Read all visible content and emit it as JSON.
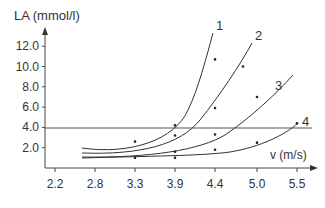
{
  "chart_data": {
    "type": "line",
    "title": "",
    "xlabel": "v (m/s)",
    "ylabel": "LA (mmol/l)",
    "x_ticks": [
      "2.2",
      "2.8",
      "3.3",
      "3.9",
      "4.4",
      "5.0",
      "5.5"
    ],
    "y_ticks": [
      "2.0",
      "4.0",
      "6.0",
      "8.0",
      "10.0",
      "12.0"
    ],
    "ylim": [
      0,
      13
    ],
    "grid": false,
    "threshold_line": {
      "y": 4.0,
      "label": ""
    },
    "series": [
      {
        "name": "1",
        "points": [
          [
            3.3,
            2.6
          ],
          [
            3.9,
            4.2
          ],
          [
            4.4,
            10.7
          ]
        ]
      },
      {
        "name": "2",
        "points": [
          [
            3.9,
            3.2
          ],
          [
            4.4,
            5.9
          ],
          [
            4.8,
            10.0
          ]
        ]
      },
      {
        "name": "3",
        "points": [
          [
            3.9,
            1.6
          ],
          [
            4.4,
            3.3
          ],
          [
            5.0,
            7.0
          ]
        ]
      },
      {
        "name": "4",
        "points": [
          [
            3.3,
            1.0
          ],
          [
            3.9,
            1.0
          ],
          [
            4.4,
            1.8
          ],
          [
            5.0,
            2.5
          ],
          [
            5.5,
            4.4
          ]
        ]
      }
    ],
    "curve_labels": [
      "1",
      "2",
      "3",
      "4"
    ]
  }
}
